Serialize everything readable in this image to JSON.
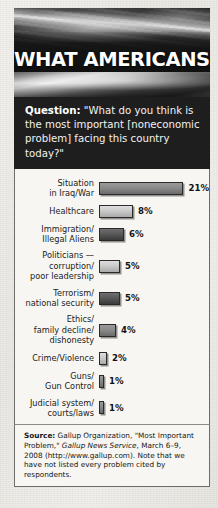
{
  "banner": {
    "title": "WHAT AMERICANS THINK",
    "image_name": "american-flag-photo"
  },
  "question": {
    "label": "Question:",
    "body": " \"What do you think is the most important [noneconomic problem] facing this country today?\""
  },
  "chart_data": {
    "type": "bar",
    "orientation": "horizontal",
    "title": "WHAT AMERICANS THINK",
    "subtitle": "Question: \"What do you think is the most important [noneconomic problem] facing this country today?\"",
    "xlabel": "",
    "ylabel": "",
    "xlim": [
      0,
      21
    ],
    "grid": false,
    "legend": null,
    "value_suffix": "%",
    "categories": [
      "Situation in Iraq/War",
      "Healthcare",
      "Immigration/ Illegal Aliens",
      "Politicians — corruption/ poor leadership",
      "Terrorism/ national security",
      "Ethics/ family decline/ dishonesty",
      "Crime/Violence",
      "Guns/ Gun Control",
      "Judicial system/ courts/laws"
    ],
    "values": [
      21,
      8,
      6,
      5,
      5,
      4,
      2,
      1,
      1
    ],
    "bars": [
      {
        "label_lines": [
          "Situation",
          "in Iraq/War"
        ],
        "value": 21,
        "value_label": "21%",
        "tone": "tone-mid"
      },
      {
        "label_lines": [
          "Healthcare"
        ],
        "value": 8,
        "value_label": "8%",
        "tone": "tone-light"
      },
      {
        "label_lines": [
          "Immigration/",
          "Illegal Aliens"
        ],
        "value": 6,
        "value_label": "6%",
        "tone": "tone-dark"
      },
      {
        "label_lines": [
          "Politicians —",
          "corruption/",
          "poor leadership"
        ],
        "value": 5,
        "value_label": "5%",
        "tone": "tone-light"
      },
      {
        "label_lines": [
          "Terrorism/",
          "national security"
        ],
        "value": 5,
        "value_label": "5%",
        "tone": "tone-dark"
      },
      {
        "label_lines": [
          "Ethics/",
          "family decline/",
          "dishonesty"
        ],
        "value": 4,
        "value_label": "4%",
        "tone": "tone-mid"
      },
      {
        "label_lines": [
          "Crime/Violence"
        ],
        "value": 2,
        "value_label": "2%",
        "tone": "tone-light"
      },
      {
        "label_lines": [
          "Guns/",
          "Gun Control"
        ],
        "value": 1,
        "value_label": "1%",
        "tone": "tone-mid"
      },
      {
        "label_lines": [
          "Judicial system/",
          "courts/laws"
        ],
        "value": 1,
        "value_label": "1%",
        "tone": "tone-mid"
      }
    ]
  },
  "source": {
    "label": "Source:",
    "part1": " Gallup Organization, \"Most Important Problem,\" ",
    "italic": "Gallup News Service",
    "part2": ", March 6–9, 2008 (http://www.gallup.com). Note that we have not listed every problem cited by respondents."
  },
  "colors": {
    "panel_dark": "#1e1e1e",
    "paper": "#f7f6f3",
    "bar_outline": "#2a2a2a",
    "page_background": "#eceae6"
  }
}
